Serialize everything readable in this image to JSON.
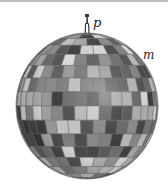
{
  "figure": {
    "labels": {
      "pivot": "p",
      "mass": "m"
    },
    "colors": {
      "background": "#ffffff",
      "top_rule": "#bdbdbd",
      "hook": "#3a3a3a",
      "label": "#222222"
    }
  }
}
